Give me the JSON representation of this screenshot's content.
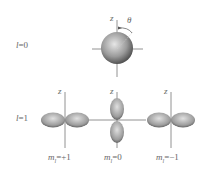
{
  "rows": [
    {
      "label": "l=0",
      "label_l": "l",
      "label_rest": "=0"
    },
    {
      "label": "l=1",
      "label_l": "l",
      "label_rest": "=1"
    }
  ],
  "axis_label": "z",
  "angle_label": "θ",
  "orbitals_l1": [
    {
      "m_label": "m",
      "m_sub": "l",
      "m_value": "=+1"
    },
    {
      "m_label": "m",
      "m_sub": "l",
      "m_value": "=0"
    },
    {
      "m_label": "m",
      "m_sub": "l",
      "m_value": "=−1"
    }
  ],
  "colors": {
    "lobe_dark": "#3a3a3a",
    "lobe_light": "#d8d8d8",
    "axis": "#777777"
  }
}
